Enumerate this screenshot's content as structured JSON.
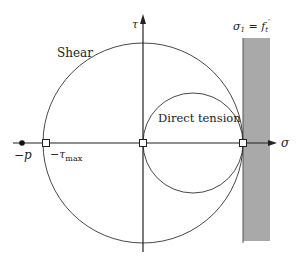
{
  "diagram": {
    "labels": {
      "shear": "Shear",
      "direct_tension": "Direct tension",
      "tau_axis": "τ",
      "sigma_axis": "σ",
      "neg_p": "−p",
      "neg_tau_max_base": "−τ",
      "neg_tau_max_sub": "max",
      "cutoff_lhs": "σ",
      "cutoff_lhs_sub": "1",
      "cutoff_eq": " = ",
      "cutoff_rhs": "f",
      "cutoff_rhs_sub": "t",
      "cutoff_prime": "′"
    },
    "colors": {
      "line": "#333333",
      "band": "#a9a9a9",
      "band_edge": "#555555",
      "marker_fill": "#ffffff",
      "dot": "#111111"
    },
    "geometry": {
      "origin": [
        143,
        143
      ],
      "shear_circle_radius": 100,
      "tension_circle_center": [
        193,
        143
      ],
      "tension_circle_radius": 50,
      "band_x": [
        243,
        270
      ],
      "band_y": [
        38,
        241
      ]
    },
    "points": [
      {
        "name": "neg-p",
        "x": 22,
        "type": "filled-dot"
      },
      {
        "name": "neg-tau-max",
        "x": 46,
        "type": "open-square"
      },
      {
        "name": "origin",
        "x": 143,
        "type": "open-square"
      },
      {
        "name": "tension-strength",
        "x": 243,
        "type": "open-square"
      }
    ]
  }
}
